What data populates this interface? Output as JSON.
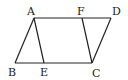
{
  "figure": {
    "points": {
      "A": {
        "label": "A",
        "x": 34,
        "y": 18
      },
      "F": {
        "label": "F",
        "x": 82,
        "y": 18
      },
      "D": {
        "label": "D",
        "x": 111,
        "y": 18
      },
      "B": {
        "label": "B",
        "x": 15,
        "y": 63
      },
      "E": {
        "label": "E",
        "x": 44,
        "y": 63
      },
      "C": {
        "label": "C",
        "x": 92,
        "y": 63
      }
    },
    "segments": [
      "AD",
      "BC",
      "AB",
      "DC",
      "AE",
      "FC"
    ]
  }
}
